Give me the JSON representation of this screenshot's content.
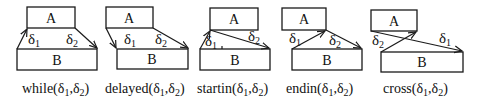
{
  "diagram": {
    "stroke_color": "#1a1a1a",
    "relations": [
      {
        "id": "while",
        "caption": "while(δ1,δ2)",
        "caption_parts": {
          "name": "while(",
          "d": "δ",
          "s1": "1",
          "comma": ",",
          "d2": "δ",
          "s2": "2",
          "close": ")"
        },
        "box_a": {
          "label": "A"
        },
        "box_b": {
          "label": "B"
        },
        "delta1": {
          "sym": "δ",
          "sub": "1"
        },
        "delta2": {
          "sym": "δ",
          "sub": "2"
        }
      },
      {
        "id": "delayed",
        "caption": "delayed(δ1,δ2)",
        "caption_parts": {
          "name": "delayed(",
          "d": "δ",
          "s1": "1",
          "comma": ",",
          "d2": "δ",
          "s2": "2",
          "close": ")"
        },
        "box_a": {
          "label": "A"
        },
        "box_b": {
          "label": "B"
        },
        "delta1": {
          "sym": "δ",
          "sub": "1"
        },
        "delta2": {
          "sym": "δ",
          "sub": "2"
        }
      },
      {
        "id": "startin",
        "caption": "startin(δ1,δ2)",
        "caption_parts": {
          "name": "startin(",
          "d": "δ",
          "s1": "1",
          "comma": ",",
          "d2": "δ",
          "s2": "2",
          "close": ")"
        },
        "box_a": {
          "label": "A"
        },
        "box_b": {
          "label": "B"
        },
        "delta1": {
          "sym": "δ",
          "sub": "1"
        },
        "delta2": {
          "sym": "δ",
          "sub": "2"
        }
      },
      {
        "id": "endin",
        "caption": "endin(δ1,δ2)",
        "caption_parts": {
          "name": "endin(",
          "d": "δ",
          "s1": "1",
          "comma": ",",
          "d2": "δ",
          "s2": "2",
          "close": ")"
        },
        "box_a": {
          "label": "A"
        },
        "box_b": {
          "label": "B"
        },
        "delta1": {
          "sym": "δ",
          "sub": "1"
        },
        "delta2": {
          "sym": "δ",
          "sub": "2"
        }
      },
      {
        "id": "cross",
        "caption": "cross(δ1,δ2)",
        "caption_parts": {
          "name": "cross(",
          "d": "δ",
          "s1": "1",
          "comma": ",",
          "d2": "δ",
          "s2": "2",
          "close": ")"
        },
        "box_a": {
          "label": "A"
        },
        "box_b": {
          "label": "B"
        },
        "delta1": {
          "sym": "δ",
          "sub": "1"
        },
        "delta2": {
          "sym": "δ",
          "sub": "2"
        }
      }
    ]
  }
}
